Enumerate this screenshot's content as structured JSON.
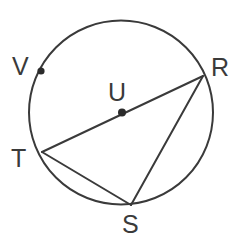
{
  "figure": {
    "background_color": "#ffffff",
    "stroke_color": "#3a3a3a",
    "label_color": "#3a3a3a",
    "dot_color": "#2b2b2b",
    "stroke_width": 2
  },
  "circle": {
    "name": "circle-U",
    "center_x": 121,
    "center_y": 112.5,
    "radius": 92
  },
  "points": [
    {
      "id": "V",
      "label": "V",
      "x": 41,
      "y": 71,
      "has_dot": true,
      "label_x": 12,
      "label_y": 54
    },
    {
      "id": "R",
      "label": "R",
      "x": 203,
      "y": 76,
      "has_dot": false,
      "label_x": 211,
      "label_y": 55
    },
    {
      "id": "U",
      "label": "U",
      "x": 122,
      "y": 112.5,
      "has_dot": true,
      "label_x": 108,
      "label_y": 80
    },
    {
      "id": "T",
      "label": "T",
      "x": 42,
      "y": 152,
      "has_dot": false,
      "label_x": 11,
      "label_y": 146
    },
    {
      "id": "S",
      "label": "S",
      "x": 131,
      "y": 205,
      "has_dot": false,
      "label_x": 122,
      "label_y": 212
    }
  ],
  "segments": [
    {
      "id": "TR",
      "name": "diameter-T-R",
      "from": "T",
      "to": "R",
      "x1": 42,
      "y1": 152,
      "x2": 203,
      "y2": 76
    },
    {
      "id": "TS",
      "name": "chord-T-S",
      "from": "T",
      "to": "S",
      "x1": 42,
      "y1": 152,
      "x2": 131,
      "y2": 205
    },
    {
      "id": "RS",
      "name": "chord-R-S",
      "from": "R",
      "to": "S",
      "x1": 203,
      "y1": 76,
      "x2": 131,
      "y2": 205
    }
  ],
  "dots": [
    {
      "id": "dot-V",
      "x": 41,
      "y": 71,
      "r": 3.6
    },
    {
      "id": "dot-U",
      "x": 122,
      "y": 112.5,
      "r": 4.0
    }
  ]
}
